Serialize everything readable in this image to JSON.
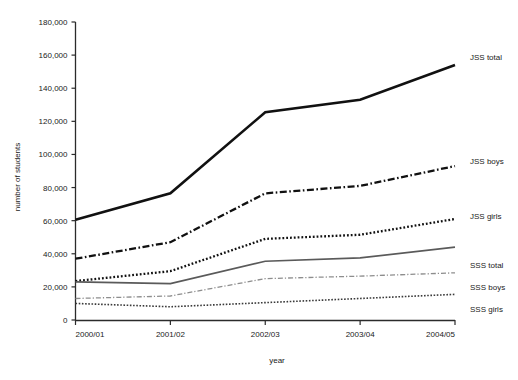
{
  "chart_data": {
    "type": "line",
    "title": "",
    "subtitle": "",
    "xlabel": "year",
    "ylabel": "number of students",
    "categories": [
      "2000/01",
      "2001/02",
      "2002/03",
      "2003/04",
      "2004/05"
    ],
    "x": [
      "2000/01",
      "2001/02",
      "2002/03",
      "2003/04",
      "2004/05"
    ],
    "ylim": [
      0,
      180000
    ],
    "ytick_values": [
      0,
      20000,
      40000,
      60000,
      80000,
      100000,
      120000,
      140000,
      160000,
      180000
    ],
    "ytick_labels": [
      "0",
      "20,000",
      "40,000",
      "60,000",
      "80,000",
      "100,000",
      "120,000",
      "140,000",
      "160,000",
      "180,000"
    ],
    "xtick_labels": [
      "2000/01",
      "2001/02",
      "2002/03",
      "2003/04",
      "2004/05"
    ],
    "grid": false,
    "legend_position": "right-inline-labels",
    "series": [
      {
        "name": "JSS total",
        "values": [
          60500,
          76500,
          125500,
          133000,
          154000
        ],
        "style": "solid",
        "color": "#111111",
        "width": 2.6,
        "dasharray": ""
      },
      {
        "name": "JSS boys",
        "values": [
          37000,
          47000,
          76500,
          81000,
          93000
        ],
        "style": "dash-dot",
        "color": "#111111",
        "width": 2.3,
        "dasharray": "7,2.5,1.6,2.5"
      },
      {
        "name": "JSS girls",
        "values": [
          23500,
          29500,
          49000,
          51500,
          61000
        ],
        "style": "dotted",
        "color": "#111111",
        "width": 2.3,
        "dasharray": "1.8,2.0"
      },
      {
        "name": "SSS total",
        "values": [
          23000,
          22000,
          35500,
          37500,
          44000
        ],
        "style": "solid",
        "color": "#5a5a5a",
        "width": 1.7,
        "dasharray": ""
      },
      {
        "name": "SSS boys",
        "values": [
          13000,
          14500,
          25000,
          26500,
          28500
        ],
        "style": "dash-dot",
        "color": "#8d8d8d",
        "width": 1.3,
        "dasharray": "5,2,1.2,2"
      },
      {
        "name": "SSS girls",
        "values": [
          10000,
          8000,
          10500,
          13000,
          15500
        ],
        "style": "dotted",
        "color": "#3a3a3a",
        "width": 1.6,
        "dasharray": "1.6,1.6"
      }
    ],
    "series_labels": [
      {
        "name": "JSS total",
        "text": "JSS total",
        "x": 470,
        "y": 60
      },
      {
        "name": "JSS boys",
        "text": "JSS boys",
        "x": 470,
        "y": 164
      },
      {
        "name": "JSS girls",
        "text": "JSS girls",
        "x": 470,
        "y": 219
      },
      {
        "name": "SSS total",
        "text": "SSS total",
        "x": 470,
        "y": 268
      },
      {
        "name": "SSS boys",
        "text": "SSS boys",
        "x": 470,
        "y": 290
      },
      {
        "name": "SSS girls",
        "text": "SSS girls",
        "x": 470,
        "y": 312
      }
    ],
    "colors": {
      "axis": "#2b2b2b",
      "text": "#1a1a1a",
      "background": "#ffffff",
      "jss_total": "#111111",
      "jss_boys": "#111111",
      "jss_girls": "#111111",
      "sss_total": "#5a5a5a",
      "sss_boys": "#8d8d8d",
      "sss_girls": "#3a3a3a"
    }
  }
}
